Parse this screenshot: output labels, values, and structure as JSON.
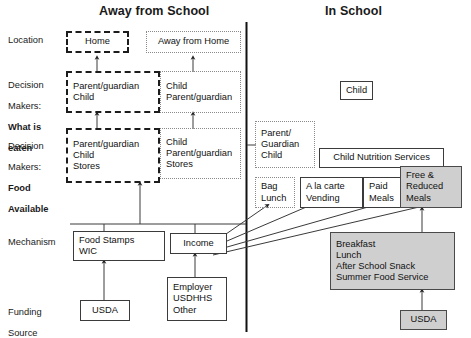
{
  "headers": {
    "left": "Away from School",
    "right": "In School"
  },
  "row_labels": [
    {
      "id": "location",
      "text": "Location"
    },
    {
      "id": "dm-what",
      "line1": "Decision",
      "line2": "Makers:",
      "line3": "What is",
      "line4": "eaten"
    },
    {
      "id": "dm-food",
      "line1": "Decision",
      "line2": "Makers:",
      "line3": "Food",
      "line4": "Available"
    },
    {
      "id": "mechanism",
      "text": "Mechanism"
    },
    {
      "id": "funding",
      "line1": "Funding",
      "line2": "Source"
    }
  ],
  "boxes": {
    "home": {
      "label": "Home",
      "style": "dashed"
    },
    "away_from_home": {
      "label": "Away from Home",
      "style": "dotted"
    },
    "dm_what_home": {
      "lines": [
        "Parent/guardian",
        "Child"
      ],
      "style": "dashed"
    },
    "dm_what_away": {
      "lines": [
        "Child",
        "Parent/guardian"
      ],
      "style": "dotted"
    },
    "dm_food_home": {
      "lines": [
        "Parent/guardian",
        "Child",
        "Stores"
      ],
      "style": "dashed"
    },
    "dm_food_away": {
      "lines": [
        "Child",
        "Parent/guardian",
        "Stores"
      ],
      "style": "dotted"
    },
    "child_in_school": {
      "label": "Child",
      "style": "solid"
    },
    "parent_guardian_child": {
      "lines": [
        "Parent/",
        "Guardian",
        "Child"
      ],
      "style": "dotted"
    },
    "child_nutrition_services": {
      "label": "Child Nutrition Services",
      "style": "solid"
    },
    "bag_lunch": {
      "lines": [
        "Bag",
        "Lunch"
      ],
      "style": "dotted"
    },
    "a_la_carte": {
      "lines": [
        "A la carte",
        "Vending"
      ],
      "style": "solid"
    },
    "paid_meals": {
      "lines": [
        "Paid",
        "Meals"
      ],
      "style": "solid"
    },
    "free_reduced": {
      "lines": [
        "Free &",
        "Reduced",
        "Meals"
      ],
      "style": "shaded"
    },
    "food_stamps": {
      "lines": [
        "Food Stamps",
        "WIC"
      ],
      "style": "solid"
    },
    "income": {
      "label": "Income",
      "style": "solid"
    },
    "school_meal_programs": {
      "lines": [
        "Breakfast",
        "Lunch",
        "After School Snack",
        "Summer Food Service"
      ],
      "style": "shaded"
    },
    "usda_left": {
      "label": "USDA",
      "style": "solid"
    },
    "employer": {
      "lines": [
        "Employer",
        "USDHHS",
        "Other"
      ],
      "style": "solid"
    },
    "usda_right": {
      "label": "USDA",
      "style": "shaded"
    }
  },
  "colors": {
    "shaded_fill": "#cfcfcf",
    "line": "#4a4a4a",
    "text": "#111111"
  }
}
